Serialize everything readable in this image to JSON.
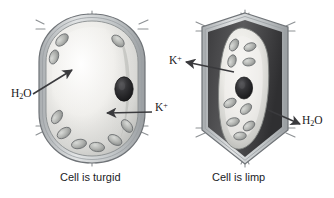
{
  "figure": {
    "background_color": "#ffffff",
    "palette": {
      "ink": "#17171a",
      "wall_line": "#6f7377",
      "wall_fill": "#c9ccce",
      "cytoplasm_light": "#f0efec",
      "cytoplasm_mid": "#d2d2cf",
      "vacuole_shadow": "#9a9a97",
      "chloroplast_fill": "#b5b7b4",
      "chloroplast_edge": "#6d7072",
      "nucleus_fill": "#2b2b2d",
      "limp_gap": "#4a4a4c",
      "arrow": "#3a3a3d"
    }
  },
  "panels": [
    {
      "id": "turgid",
      "caption": "Cell is turgid",
      "state": "turgid",
      "shape": "plump rounded cell filling the wall",
      "labels": [
        {
          "id": "h2o-left",
          "species": "H2O",
          "text_main": "H",
          "text_sub": "2",
          "text_tail": "O",
          "direction": "into cell",
          "arrow": "points up-right toward cytoplasm"
        },
        {
          "id": "k-left",
          "species": "K+",
          "text_main": "K",
          "text_sup": "+",
          "direction": "into cell",
          "arrow": "points left toward cytoplasm"
        }
      ],
      "organelles": {
        "nucleus": 1,
        "chloroplasts": 9
      }
    },
    {
      "id": "limp",
      "caption": "Cell is limp",
      "state": "limp",
      "shape": "shrunken protoplast pulled away from the cell wall",
      "labels": [
        {
          "id": "k-right",
          "species": "K+",
          "text_main": "K",
          "text_sup": "+",
          "direction": "out of cell",
          "arrow": "points left away from cytoplasm"
        },
        {
          "id": "h2o-right",
          "species": "H2O",
          "text_main": "H",
          "text_sub": "2",
          "text_tail": "O",
          "direction": "out of cell",
          "arrow": "points right away from cytoplasm"
        }
      ],
      "organelles": {
        "nucleus": 1,
        "chloroplasts": 9
      }
    }
  ]
}
